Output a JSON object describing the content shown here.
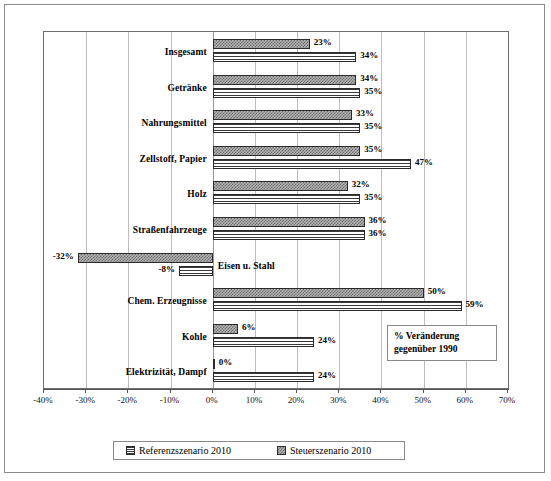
{
  "chart_data": {
    "type": "bar",
    "orientation": "horizontal",
    "title": "",
    "xlabel": "",
    "ylabel": "",
    "xlim": [
      -40,
      70
    ],
    "xtick_labels": [
      "-40%",
      "-30%",
      "-20%",
      "-10%",
      "0%",
      "10%",
      "20%",
      "30%",
      "40%",
      "50%",
      "60%",
      "70%"
    ],
    "xticks": [
      -40,
      -30,
      -20,
      -10,
      0,
      10,
      20,
      30,
      40,
      50,
      60,
      70
    ],
    "grid": true,
    "legend_position": "bottom",
    "categories": [
      "Insgesamt",
      "Getränke",
      "Nahrungsmittel",
      "Zellstoff, Papier",
      "Holz",
      "Straßenfahrzeuge",
      "Eisen u. Stahl",
      "Chem. Erzeugnisse",
      "Kohle",
      "Elektrizität, Dampf"
    ],
    "series": [
      {
        "name": "Steuerszenario 2010",
        "pattern": "checker",
        "values": [
          23,
          34,
          33,
          35,
          32,
          36,
          -32,
          50,
          6,
          0
        ],
        "labels": [
          "23%",
          "34%",
          "33%",
          "35%",
          "32%",
          "36%",
          "-32%",
          "50%",
          "6%",
          "0%"
        ]
      },
      {
        "name": "Referenzszenario 2010",
        "pattern": "horizontal-lines",
        "values": [
          34,
          35,
          35,
          47,
          35,
          36,
          -8,
          59,
          24,
          24
        ],
        "labels": [
          "34%",
          "35%",
          "35%",
          "47%",
          "35%",
          "36%",
          "-8%",
          "59%",
          "24%",
          "24%"
        ]
      }
    ],
    "annotation": {
      "line1": "% Veränderung",
      "line2": "gegenüber 1990"
    }
  },
  "legend": {
    "items": [
      {
        "label": "Referenzszenario 2010",
        "pattern": "referenz"
      },
      {
        "label": "Steuerszenario 2010",
        "pattern": "steuer"
      }
    ]
  }
}
